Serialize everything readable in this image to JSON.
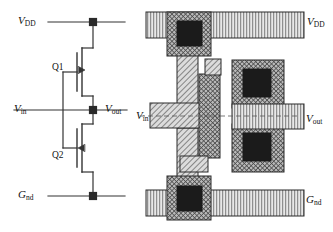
{
  "figure": {
    "panels": [
      {
        "name": "schematic",
        "side": "left"
      },
      {
        "name": "layout",
        "side": "right"
      }
    ]
  },
  "schematic": {
    "labels": {
      "vdd": "V",
      "vdd_sub": "DD",
      "vin": "V",
      "vin_sub": "in",
      "vout": "V",
      "vout_sub": "out",
      "gnd": "G",
      "gnd_sub": "nd",
      "q1": "Q1",
      "q2": "Q2"
    },
    "devices": [
      {
        "id": "Q1",
        "type": "pmos",
        "name": "pull-up-transistor"
      },
      {
        "id": "Q2",
        "type": "nmos",
        "name": "pull-down-transistor"
      }
    ],
    "nodes": [
      {
        "name": "vdd-rail-junction"
      },
      {
        "name": "output-node-junction"
      },
      {
        "name": "gnd-rail-junction"
      }
    ]
  },
  "layout": {
    "labels": {
      "vdd": "V",
      "vdd_sub": "DD",
      "vin": "V",
      "vin_sub": "in",
      "vout": "V",
      "vout_sub": "out",
      "gnd": "G",
      "gnd_sub": "nd"
    },
    "layers": [
      {
        "name": "metal",
        "pattern": "vertical-lines",
        "color": "#d9d9d9"
      },
      {
        "name": "polysilicon",
        "pattern": "diagonal-hatch",
        "color": "#c8c8c8"
      },
      {
        "name": "diffusion",
        "pattern": "cross-hatch",
        "color": "#a8a8a8"
      },
      {
        "name": "contact-cut",
        "pattern": "solid",
        "color": "#1a1a1a"
      }
    ],
    "contacts": [
      {
        "name": "vdd-contact"
      },
      {
        "name": "pmos-drain-contact"
      },
      {
        "name": "nmos-drain-contact"
      },
      {
        "name": "gnd-contact"
      }
    ],
    "rails": [
      {
        "name": "vdd-metal-rail"
      },
      {
        "name": "gnd-metal-rail"
      },
      {
        "name": "vout-metal-rail"
      }
    ]
  },
  "colors": {
    "ink": "#1a1a1a",
    "metal_fill": "#dcdcdc",
    "poly_fill": "#c9c9c9",
    "diff_fill": "#b0b0b0",
    "contact_fill": "#1b1b1b",
    "background": "#ffffff"
  }
}
